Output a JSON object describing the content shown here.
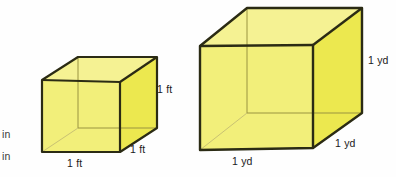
{
  "figure": {
    "background_color": "#fefefe",
    "cube_fill_front": "#f2ef7a",
    "cube_fill_top": "#f5f293",
    "cube_fill_side": "#ece84f",
    "cube_edge_color": "#2b2b14",
    "cube_hidden_edge_color": "#9a9440"
  },
  "cut_off_labels": [
    {
      "text": "in"
    },
    {
      "text": "in"
    }
  ],
  "small_cube": {
    "name": "cubic-foot",
    "unit": "ft",
    "labels": {
      "height": "1 ft",
      "depth": "1 ft",
      "width": "1 ft"
    }
  },
  "large_cube": {
    "name": "cubic-yard",
    "unit": "yd",
    "labels": {
      "height": "1 yd",
      "depth": "1 yd",
      "width": "1 yd"
    }
  }
}
